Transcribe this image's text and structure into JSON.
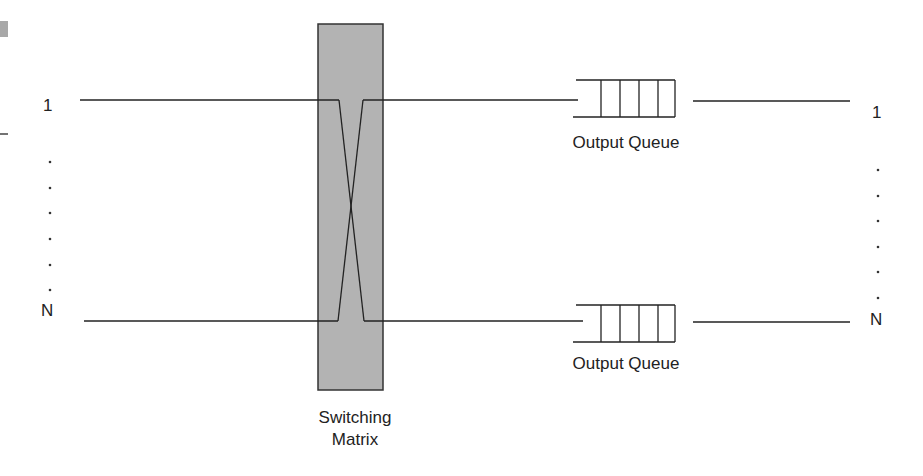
{
  "diagram": {
    "inputs": {
      "first_label": "1",
      "last_label": "N",
      "ellipsis_dots": 6
    },
    "outputs": {
      "first_label": "1",
      "last_label": "N",
      "ellipsis_dots": 6
    },
    "switch": {
      "label_line1": "Switching",
      "label_line2": "Matrix",
      "fill": "#b3b3b3"
    },
    "queues": [
      {
        "label": "Output Queue",
        "cells": 4
      },
      {
        "label": "Output Queue",
        "cells": 4
      }
    ],
    "colors": {
      "line": "#222222",
      "switch_fill": "#b3b3b3",
      "corner_mark": "#a8a8a8"
    }
  }
}
